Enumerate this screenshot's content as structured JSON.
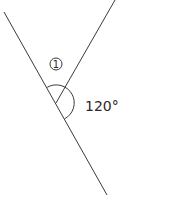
{
  "diagram": {
    "type": "angle-figure",
    "lines": [
      {
        "name": "line-straight",
        "from": [
          4,
          12
        ],
        "to": [
          107,
          195
        ]
      },
      {
        "name": "ray-upper-right",
        "from": [
          56,
          103
        ],
        "to": [
          115,
          0
        ]
      }
    ],
    "vertex": [
      56,
      103
    ],
    "labels": {
      "angle_marker": "1",
      "angle_value": "120°"
    },
    "colors": {
      "stroke": "#3a3a3a",
      "text": "#2a2a2a",
      "background": "#ffffff"
    }
  }
}
